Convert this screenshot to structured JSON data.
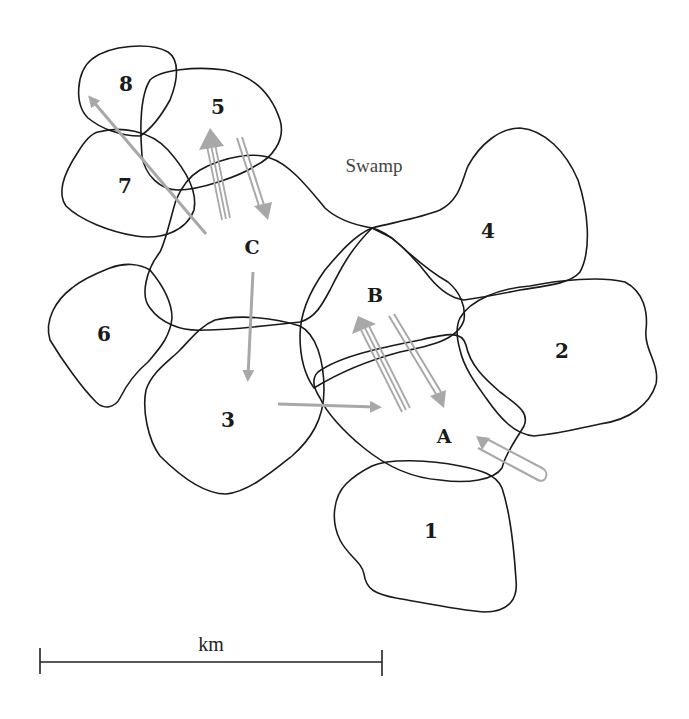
{
  "diagram": {
    "type": "territory-map",
    "colors": {
      "outline": "#1a1a1a",
      "arrow": "#a8a8a8",
      "background": "#ffffff"
    },
    "regions": [
      {
        "id": "1",
        "label": "1",
        "x": 431,
        "y": 531
      },
      {
        "id": "2",
        "label": "2",
        "x": 562,
        "y": 351
      },
      {
        "id": "3",
        "label": "3",
        "x": 228,
        "y": 420
      },
      {
        "id": "4",
        "label": "4",
        "x": 488,
        "y": 231
      },
      {
        "id": "5",
        "label": "5",
        "x": 218,
        "y": 107
      },
      {
        "id": "6",
        "label": "6",
        "x": 104,
        "y": 334
      },
      {
        "id": "7",
        "label": "7",
        "x": 125,
        "y": 186
      },
      {
        "id": "8",
        "label": "8",
        "x": 126,
        "y": 84
      },
      {
        "id": "A",
        "label": "A",
        "x": 444,
        "y": 436
      },
      {
        "id": "B",
        "label": "B",
        "x": 375,
        "y": 295
      },
      {
        "id": "C",
        "label": "C",
        "x": 252,
        "y": 247
      }
    ],
    "annotations": {
      "swamp": {
        "text": "Swamp",
        "x": 374,
        "y": 166
      }
    },
    "movements": [
      {
        "from": "C",
        "to": "8",
        "style": "single"
      },
      {
        "from": "C",
        "to": "5",
        "style": "triple"
      },
      {
        "from": "5",
        "to": "C",
        "style": "double"
      },
      {
        "from": "C",
        "to": "3",
        "style": "single"
      },
      {
        "from": "3",
        "to": "A",
        "style": "single"
      },
      {
        "from": "A",
        "to": "B",
        "style": "triple"
      },
      {
        "from": "B",
        "to": "A",
        "style": "double"
      },
      {
        "from": "outside",
        "to": "A",
        "style": "loop"
      }
    ]
  },
  "scale_bar": {
    "label": "km",
    "x1": 40,
    "x2": 382,
    "y": 662
  }
}
